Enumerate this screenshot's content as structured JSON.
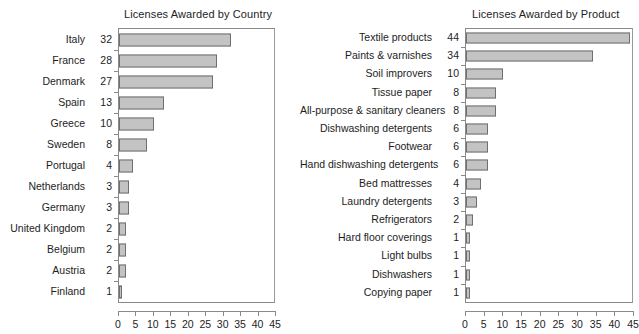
{
  "chart_data": [
    {
      "type": "bar",
      "orientation": "horizontal",
      "title": "Licenses Awarded by Country",
      "xlabel": "",
      "ylabel": "",
      "xlim": [
        0,
        45
      ],
      "xticks": [
        0,
        5,
        10,
        15,
        20,
        25,
        30,
        35,
        40,
        45
      ],
      "grid": false,
      "legend": null,
      "bar_fill": "#c3c3c3",
      "bar_border": "#6f6f6f",
      "categories": [
        "Italy",
        "France",
        "Denmark",
        "Spain",
        "Greece",
        "Sweden",
        "Portugal",
        "Netherlands",
        "Germany",
        "United Kingdom",
        "Belgium",
        "Austria",
        "Finland"
      ],
      "values": [
        32,
        28,
        27,
        13,
        10,
        8,
        4,
        3,
        3,
        2,
        2,
        2,
        1
      ]
    },
    {
      "type": "bar",
      "orientation": "horizontal",
      "title": "Licenses Awarded by Product",
      "xlabel": "",
      "ylabel": "",
      "xlim": [
        0,
        45
      ],
      "xticks": [
        0,
        5,
        10,
        15,
        20,
        25,
        30,
        35,
        40,
        45
      ],
      "grid": false,
      "legend": null,
      "bar_fill": "#c3c3c3",
      "bar_border": "#6f6f6f",
      "categories": [
        "Textile products",
        "Paints & varnishes",
        "Soil improvers",
        "Tissue paper",
        "All-purpose & sanitary cleaners",
        "Dishwashing detergents",
        "Footwear",
        "Hand dishwashing detergents",
        "Bed mattresses",
        "Laundry detergents",
        "Refrigerators",
        "Hard floor coverings",
        "Light bulbs",
        "Dishwashers",
        "Copying paper"
      ],
      "values": [
        44,
        34,
        10,
        8,
        8,
        6,
        6,
        6,
        4,
        3,
        2,
        1,
        1,
        1,
        1
      ]
    }
  ]
}
